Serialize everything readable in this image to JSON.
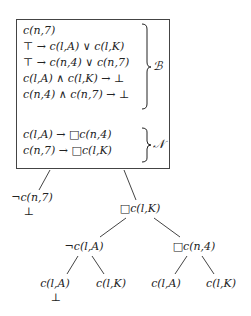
{
  "box": {
    "B_block": {
      "lines": [
        "c(n,7)",
        "⊤ → c(l,A) ∨ c(l,K)",
        "⊤ → c(n,4) ∨ c(n,7)",
        "c(l,A) ∧ c(l,K) → ⊥",
        "c(n,4) ∧ c(n,7) → ⊥"
      ],
      "label": "ℬ"
    },
    "N_block": {
      "lines": [
        "c(l,A) → □c(n,4)",
        "c(n,7) → □c(l,K)"
      ],
      "label": "𝒩"
    }
  },
  "tree": {
    "left_branch": {
      "label": "¬c(n,7)",
      "closed": "⊥"
    },
    "right_branch": {
      "label": "□c(l,K)",
      "left": {
        "label": "¬c(l,A)",
        "children": [
          {
            "label": "c(l,A)",
            "closed": "⊥"
          },
          {
            "label": "c(l,K)"
          }
        ]
      },
      "right": {
        "label": "□c(n,4)",
        "children": [
          {
            "label": "c(l,A)"
          },
          {
            "label": "c(l,K)"
          }
        ]
      }
    }
  }
}
